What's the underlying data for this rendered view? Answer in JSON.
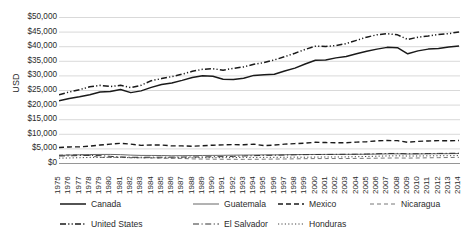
{
  "chart_data": {
    "type": "line",
    "title": "",
    "xlabel": "",
    "ylabel": "USD",
    "ylim": [
      0,
      50000
    ],
    "ytick_step": 5000,
    "grid": true,
    "legend_position": "bottom",
    "ytick_labels": [
      "$50,000",
      "$45,000",
      "$40,000",
      "$35,000",
      "$30,000",
      "$25,000",
      "$20,000",
      "$15,000",
      "$10,000",
      "$5,000",
      "$0"
    ],
    "ytick_values": [
      50000,
      45000,
      40000,
      35000,
      30000,
      25000,
      20000,
      15000,
      10000,
      5000,
      0
    ],
    "categories": [
      "1975",
      "1976",
      "1977",
      "1978",
      "1979",
      "1980",
      "1981",
      "1982",
      "1983",
      "1984",
      "1985",
      "1986",
      "1987",
      "1988",
      "1989",
      "1990",
      "1991",
      "1992",
      "1993",
      "1994",
      "1995",
      "1996",
      "1997",
      "1998",
      "1999",
      "2000",
      "2001",
      "2002",
      "2003",
      "2004",
      "2005",
      "2006",
      "2007",
      "2008",
      "2009",
      "2010",
      "2011",
      "2012",
      "2013",
      "2014"
    ],
    "series": [
      {
        "name": "Canada",
        "style": "solid",
        "color": "#1a1a1a",
        "width": 1.5,
        "values": [
          21300,
          22100,
          22700,
          23400,
          24300,
          24500,
          25200,
          24100,
          24700,
          25900,
          26900,
          27400,
          28300,
          29300,
          29900,
          29700,
          28700,
          28600,
          29000,
          30000,
          30200,
          30400,
          31500,
          32500,
          33900,
          35200,
          35300,
          36000,
          36500,
          37400,
          38300,
          39000,
          39600,
          39500,
          37400,
          38400,
          39000,
          39200,
          39700,
          40100
        ]
      },
      {
        "name": "Guatemala",
        "style": "solid-thin",
        "color": "#555555",
        "width": 0.9,
        "values": [
          2600,
          2720,
          2830,
          2900,
          2930,
          2940,
          2860,
          2700,
          2600,
          2590,
          2560,
          2480,
          2510,
          2540,
          2580,
          2610,
          2630,
          2690,
          2720,
          2740,
          2790,
          2790,
          2840,
          2890,
          2910,
          2930,
          2940,
          2950,
          2960,
          2980,
          3000,
          3060,
          3120,
          3140,
          3090,
          3110,
          3150,
          3170,
          3200,
          3240
        ]
      },
      {
        "name": "Mexico",
        "style": "dashed",
        "color": "#1a1a1a",
        "width": 1.4,
        "values": [
          5300,
          5500,
          5520,
          5800,
          6150,
          6450,
          6750,
          6450,
          6050,
          6150,
          6150,
          5850,
          5850,
          5750,
          5900,
          6100,
          6200,
          6300,
          6250,
          6450,
          5950,
          6150,
          6450,
          6650,
          6800,
          7100,
          7000,
          6950,
          6950,
          7150,
          7300,
          7600,
          7700,
          7650,
          7100,
          7400,
          7550,
          7650,
          7600,
          7700
        ]
      },
      {
        "name": "Nicaragua",
        "style": "dashed-thin",
        "color": "#666666",
        "width": 0.9,
        "values": [
          2700,
          2800,
          2900,
          2550,
          1900,
          1900,
          1950,
          1800,
          1800,
          1720,
          1640,
          1600,
          1570,
          1400,
          1350,
          1300,
          1280,
          1270,
          1250,
          1270,
          1300,
          1350,
          1380,
          1420,
          1480,
          1510,
          1520,
          1520,
          1530,
          1570,
          1600,
          1650,
          1700,
          1720,
          1680,
          1720,
          1780,
          1830,
          1880,
          1940
        ]
      },
      {
        "name": "United States",
        "style": "dash-dot-dot",
        "color": "#1a1a1a",
        "width": 1.5,
        "values": [
          23400,
          24300,
          25100,
          26100,
          26600,
          26200,
          26600,
          25800,
          26600,
          28200,
          28900,
          29600,
          30400,
          31400,
          32100,
          32300,
          31800,
          32400,
          32900,
          33800,
          34400,
          35300,
          36400,
          37600,
          38900,
          40000,
          39900,
          40200,
          40900,
          42000,
          43100,
          43900,
          44300,
          43900,
          42300,
          43100,
          43500,
          44000,
          44300,
          44900
        ]
      },
      {
        "name": "El Salvador",
        "style": "dash-dot",
        "color": "#333333",
        "width": 1.0,
        "values": [
          2400,
          2440,
          2560,
          2600,
          2520,
          2280,
          2080,
          1960,
          1970,
          1990,
          1990,
          2000,
          2030,
          2060,
          2080,
          2140,
          2180,
          2270,
          2400,
          2500,
          2620,
          2650,
          2720,
          2800,
          2860,
          2900,
          2930,
          2960,
          2990,
          3010,
          3070,
          3160,
          3260,
          3270,
          3150,
          3180,
          3230,
          3280,
          3320,
          3360
        ]
      },
      {
        "name": "Honduras",
        "style": "dotted",
        "color": "#444444",
        "width": 1.0,
        "values": [
          1660,
          1720,
          1820,
          1890,
          1940,
          1930,
          1890,
          1810,
          1770,
          1780,
          1780,
          1770,
          1800,
          1830,
          1840,
          1830,
          1840,
          1870,
          1920,
          1900,
          1930,
          1940,
          1970,
          2010,
          1970,
          2030,
          2060,
          2070,
          2090,
          2150,
          2230,
          2330,
          2420,
          2470,
          2380,
          2400,
          2450,
          2480,
          2500,
          2540
        ]
      }
    ]
  },
  "legend": {
    "rows": [
      [
        {
          "label": "Canada",
          "style": "solid",
          "swatch": "line-solid-icon"
        },
        {
          "label": "Guatemala",
          "style": "solid-thin",
          "swatch": "line-solid-thin-icon"
        },
        {
          "label": "Mexico",
          "style": "dashed",
          "swatch": "line-dashed-icon"
        },
        {
          "label": "Nicaragua",
          "style": "dashed-thin",
          "swatch": "line-dashed-thin-icon"
        }
      ],
      [
        {
          "label": "United States",
          "style": "dash-dot-dot",
          "swatch": "line-dash-dot-dot-icon"
        },
        {
          "label": "El Salvador",
          "style": "dash-dot",
          "swatch": "line-dash-dot-icon"
        },
        {
          "label": "Honduras",
          "style": "dotted",
          "swatch": "line-dotted-icon"
        }
      ]
    ]
  },
  "colors": {
    "grid": "#c9c9c9",
    "axis": "#8a8a8a",
    "text": "#2b2b2b",
    "plot_background": "#ffffff"
  }
}
